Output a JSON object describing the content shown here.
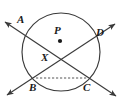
{
  "figure": {
    "kind": "circle-secants-geometry-diagram",
    "background_color": "#ffffff",
    "stroke_color": "#3a3a3a",
    "label_color": "#1a1a1a",
    "width": 122,
    "height": 102
  },
  "circle": {
    "name": "circle-P",
    "center_label": "P",
    "center_x": 61,
    "center_y": 52,
    "radius": 39,
    "center_dot_x": 60,
    "center_dot_y": 41,
    "center_dot_radius": 2.1
  },
  "labels": {
    "A": "A",
    "B": "B",
    "C": "C",
    "D": "D",
    "P": "P",
    "X": "X"
  },
  "points": [
    {
      "id": "A",
      "label": "A",
      "x": 30,
      "y": 32,
      "label_x": 20,
      "label_y": 20
    },
    {
      "id": "B",
      "label": "B",
      "x": 36,
      "y": 78,
      "label_x": 30,
      "label_y": 83
    },
    {
      "id": "C",
      "label": "C",
      "x": 87,
      "y": 78,
      "label_x": 84,
      "label_y": 83
    },
    {
      "id": "D",
      "label": "D",
      "x": 93,
      "y": 32,
      "label_x": 96,
      "label_y": 31
    },
    {
      "id": "X",
      "label": "X",
      "x": 55,
      "y": 60,
      "label_x": 42,
      "label_y": 53
    },
    {
      "id": "P",
      "label": "P",
      "x": 60,
      "y": 41,
      "label_x": 55,
      "label_y": 27
    }
  ],
  "lines": [
    {
      "id": "secant-AC",
      "name": "secant-line-ac",
      "from": "A",
      "to": "C",
      "x1": 5,
      "y1": 22,
      "x2": 116,
      "y2": 96,
      "dashed": false,
      "arrow_start": true,
      "arrow_end": true
    },
    {
      "id": "secant-BD",
      "name": "secant-line-bd",
      "from": "B",
      "to": "D",
      "x1": 7,
      "y1": 95,
      "x2": 115,
      "y2": 24,
      "dashed": false,
      "arrow_start": true,
      "arrow_end": true
    },
    {
      "id": "chord-BC",
      "name": "chord-bc",
      "from": "B",
      "to": "C",
      "x1": 36,
      "y1": 78,
      "x2": 87,
      "y2": 78,
      "dashed": true,
      "arrow_start": false,
      "arrow_end": false
    }
  ],
  "intersection": {
    "name": "intersection-x",
    "label": "X",
    "x": 55,
    "y": 60
  }
}
